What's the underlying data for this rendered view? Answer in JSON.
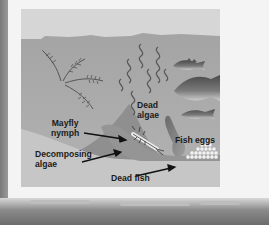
{
  "figure": {
    "type": "lake-ecosystem-diagram",
    "colors": {
      "sky": "#d6d6d6",
      "water": "#a9a9a9",
      "sediment": "#8d8d8d",
      "bottom_foreground": "#c7c7c7",
      "label_text": "#1b1b1b"
    },
    "labels": {
      "dead_algae": "Dead\nalgae",
      "mayfly_nymph": "Mayfly\nnymph",
      "decomposing_algae": "Decomposing\nalgae",
      "dead_fish": "Dead fish",
      "fish_eggs": "Fish eggs"
    },
    "icons": [
      "aquatic-plant-icon",
      "dead-algae-strand-icon",
      "fish-icon",
      "mayfly-nymph-icon",
      "dead-fish-icon",
      "fish-eggs-icon",
      "arrow-icon"
    ]
  }
}
